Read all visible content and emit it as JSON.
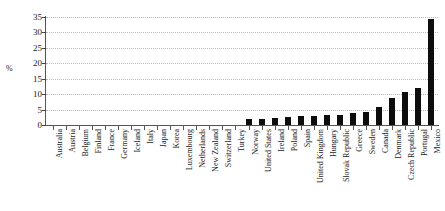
{
  "chart_data": {
    "type": "bar",
    "title": "",
    "subtitle": "",
    "xlabel": "",
    "ylabel": "%",
    "ylim": [
      0,
      35
    ],
    "yticks": [
      0,
      5,
      10,
      15,
      20,
      25,
      30,
      35
    ],
    "grid": true,
    "legend": null,
    "bar_color": "#0d0d0d",
    "categories": [
      "Australia",
      "Austria",
      "Belgium",
      "Finland",
      "France",
      "Germany",
      "Iceland",
      "Italy",
      "Japan",
      "Korea",
      "Luxembourg",
      "Netherlands",
      "New Zealand",
      "Switzerland",
      "Turkey",
      "Norway",
      "United States",
      "Ireland",
      "Poland",
      "Spain",
      "United Kingdom",
      "Hungary",
      "Slovak Republic",
      "Greece",
      "Sweden",
      "Canada",
      "Denmark",
      "Czech Republic",
      "Portugal",
      "Mexico"
    ],
    "values": [
      0,
      0,
      0,
      0,
      0,
      0,
      0,
      0,
      0,
      0,
      0,
      0,
      0,
      0,
      0,
      2.0,
      2.1,
      2.2,
      2.6,
      2.9,
      3.0,
      3.2,
      3.4,
      4.0,
      4.3,
      5.7,
      8.7,
      10.7,
      12.0,
      34.2
    ]
  }
}
